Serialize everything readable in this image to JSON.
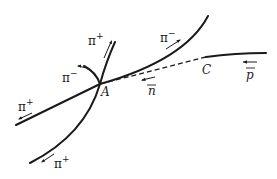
{
  "figure": {
    "vertices": [
      {
        "id": "A",
        "label": "A"
      },
      {
        "id": "C",
        "label": "C"
      }
    ],
    "tracks": [
      {
        "id": "pbar",
        "particle": "p̄",
        "label_base": "p",
        "from": "right edge",
        "to": "C",
        "style": "solid"
      },
      {
        "id": "nbar",
        "particle": "n̄",
        "label_base": "n",
        "from": "C",
        "to": "A",
        "style": "dashed"
      },
      {
        "id": "pi-minus-upper-right",
        "particle": "π⁻",
        "label_base": "π",
        "label_sup": "−",
        "from": "A",
        "to": "upper right",
        "style": "solid"
      },
      {
        "id": "pi-plus-up",
        "particle": "π⁺",
        "label_base": "π",
        "label_sup": "+",
        "from": "A",
        "to": "up",
        "style": "solid"
      },
      {
        "id": "pi-minus-short",
        "particle": "π⁻",
        "label_base": "π",
        "label_sup": "−",
        "from": "A",
        "to": "upper left (short arc)",
        "style": "solid"
      },
      {
        "id": "pi-plus-left",
        "particle": "π⁺",
        "label_base": "π",
        "label_sup": "+",
        "from": "A",
        "to": "lower left",
        "style": "solid"
      },
      {
        "id": "pi-plus-down",
        "particle": "π⁺",
        "label_base": "π",
        "label_sup": "+",
        "from": "A",
        "to": "bottom left",
        "style": "solid"
      }
    ],
    "colors": {
      "ink": "#1a1a1a",
      "background": "#ffffff"
    }
  }
}
